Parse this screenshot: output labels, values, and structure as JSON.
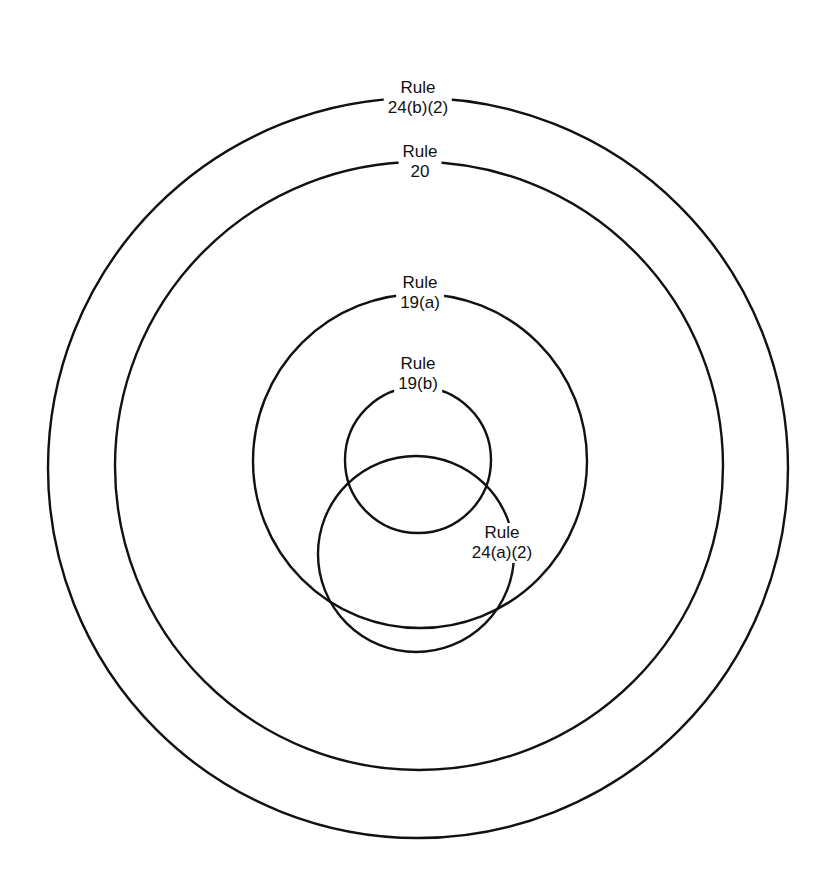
{
  "diagram": {
    "type": "nested-circles",
    "stroke_color": "#111111",
    "background": "#ffffff",
    "circles": [
      {
        "id": "rule-24b2",
        "label_line1": "Rule",
        "label_line2": "24(b)(2)",
        "cx": 418,
        "cy": 468,
        "r": 370,
        "label_x": 418,
        "label_y": 64
      },
      {
        "id": "rule-20",
        "label_line1": "Rule",
        "label_line2": "20",
        "cx": 419,
        "cy": 466,
        "r": 304,
        "label_x": 420,
        "label_y": 130
      },
      {
        "id": "rule-19a",
        "label_line1": "Rule",
        "label_line2": "19(a)",
        "cx": 420,
        "cy": 461,
        "r": 167,
        "label_x": 418,
        "label_y": 262
      },
      {
        "id": "rule-19b",
        "label_line1": "Rule",
        "label_line2": "19(b)",
        "cx": 418,
        "cy": 460,
        "r": 73,
        "label_x": 418,
        "label_y": 353
      },
      {
        "id": "rule-24a2",
        "label_line1": "Rule",
        "label_line2": "24(a)(2)",
        "cx": 416,
        "cy": 554,
        "r": 98,
        "label_x": 502,
        "label_y": 522
      }
    ]
  }
}
